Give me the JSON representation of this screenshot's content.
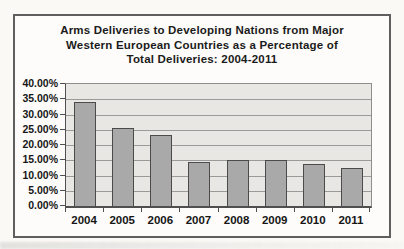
{
  "page": {
    "background": "#faf9f6"
  },
  "chart": {
    "title_lines": [
      "Arms Deliveries to Developing Nations from Major",
      "Western European Countries as a Percentage of",
      "Total Deliveries: 2004-2011"
    ],
    "colors": {
      "frame_border": "#5f5f5f",
      "frame_background": "#fdfcfa",
      "plot_background": "#e9e7e3",
      "gridline": "#9a9a9a",
      "axis_line": "#4f4f4f",
      "bar_fill": "#a9a9a9",
      "bar_border": "#4b4b4b",
      "text": "#161616"
    }
  },
  "chart_data": {
    "type": "bar",
    "title": "Arms Deliveries to Developing Nations from Major Western European Countries as a Percentage of Total Deliveries: 2004-2011",
    "categories": [
      "2004",
      "2005",
      "2006",
      "2007",
      "2008",
      "2009",
      "2010",
      "2011"
    ],
    "values": [
      34.0,
      25.6,
      23.3,
      14.5,
      15.2,
      15.1,
      13.8,
      12.5
    ],
    "values_unit": "percent",
    "xlabel": "",
    "ylabel": "",
    "ylim": [
      0,
      40
    ],
    "ytick_step": 5,
    "ytick_labels": [
      "0.00%",
      "5.00%",
      "10.00%",
      "15.00%",
      "20.00%",
      "25.00%",
      "30.00%",
      "35.00%",
      "40.00%"
    ],
    "grid": true,
    "legend": false
  }
}
